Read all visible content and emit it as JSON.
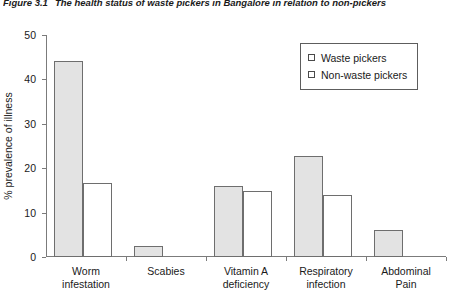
{
  "caption": {
    "number": "Figure 3.1",
    "text": "The health status of waste pickers in Bangalore in relation to non-pickers"
  },
  "chart_data": {
    "type": "bar",
    "title": "The health status of waste pickers in Bangalore in relation to non-pickers",
    "xlabel": "",
    "ylabel": "% prevalence of illness",
    "ylim": [
      0,
      50
    ],
    "yticks": [
      0,
      10,
      20,
      30,
      40,
      50
    ],
    "grid": false,
    "legend_position": "top-right",
    "categories": [
      "Worm\ninfestation",
      "Scabies",
      "Vitamin A\ndeficiency",
      "Respiratory\ninfection",
      "Abdominal\nPain"
    ],
    "series": [
      {
        "name": "Waste pickers",
        "color": "#e3e3e3",
        "values": [
          44.2,
          2.5,
          16.1,
          22.8,
          6.1
        ]
      },
      {
        "name": "Non-waste pickers",
        "color": "#ffffff",
        "values": [
          16.6,
          0,
          14.9,
          14.0,
          0
        ]
      }
    ]
  }
}
